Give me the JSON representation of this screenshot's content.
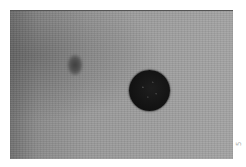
{
  "image": {
    "description": "Grayscale photograph of a textured gray surface with a small faint dark spot (upper left) and a larger round black spot (center right)",
    "colors": {
      "background": "#9c9c9c",
      "small_spot": "#4a4a4a",
      "large_spot": "#141414",
      "page": "#ffffff"
    }
  },
  "margin_mark": {
    "text": "5"
  }
}
